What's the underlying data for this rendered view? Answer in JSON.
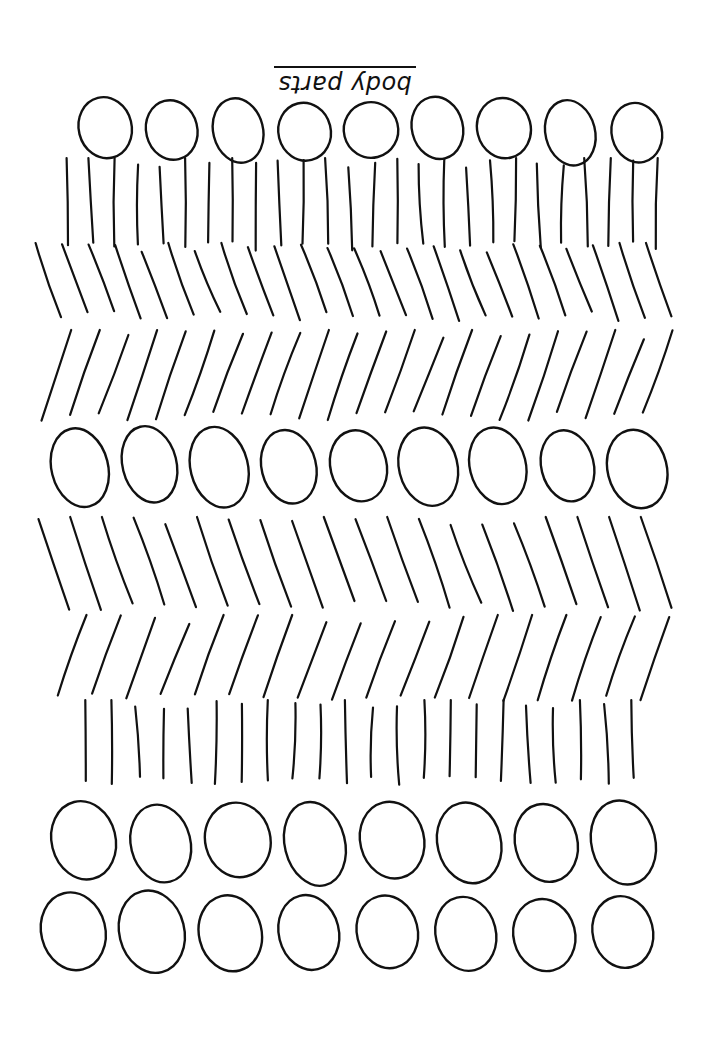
{
  "worksheet": {
    "title": "body parts",
    "title_orientation": "upside-down",
    "stroke_color": "#111111",
    "background_color": "#ffffff",
    "rows": [
      {
        "index": 1,
        "type": "ovals",
        "count": 9,
        "y_top": 97,
        "y_bottom": 163,
        "x_start": 72,
        "x_end": 670
      },
      {
        "index": 2,
        "type": "vertical-lines",
        "count": 26,
        "y_top": 158,
        "y_bottom": 250,
        "x_start": 55,
        "x_end": 668
      },
      {
        "index": 3,
        "type": "backslash-lines",
        "count": 24,
        "y_top": 243,
        "y_bottom": 320,
        "x_start": 35,
        "x_end": 672
      },
      {
        "index": 4,
        "type": "slash-lines",
        "count": 22,
        "y_top": 330,
        "y_bottom": 420,
        "x_start": 42,
        "x_end": 672
      },
      {
        "index": 5,
        "type": "ovals",
        "count": 9,
        "y_top": 425,
        "y_bottom": 508,
        "x_start": 45,
        "x_end": 672
      },
      {
        "index": 6,
        "type": "backslash-lines",
        "count": 20,
        "y_top": 517,
        "y_bottom": 610,
        "x_start": 38,
        "x_end": 672
      },
      {
        "index": 7,
        "type": "slash-lines",
        "count": 18,
        "y_top": 615,
        "y_bottom": 702,
        "x_start": 55,
        "x_end": 672
      },
      {
        "index": 8,
        "type": "vertical-lines",
        "count": 22,
        "y_top": 700,
        "y_bottom": 785,
        "x_start": 72,
        "x_end": 645
      },
      {
        "index": 9,
        "type": "ovals",
        "count": 8,
        "y_top": 797,
        "y_bottom": 885,
        "x_start": 45,
        "x_end": 662
      },
      {
        "index": 10,
        "type": "ovals",
        "count": 8,
        "y_top": 892,
        "y_bottom": 976,
        "x_start": 34,
        "x_end": 662
      }
    ]
  }
}
